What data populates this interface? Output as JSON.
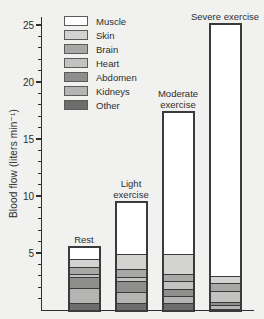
{
  "chart_data": {
    "type": "bar",
    "stacked": true,
    "ylabel": "Blood flow (liters min⁻¹)",
    "categories": [
      {
        "label": "Rest",
        "lines": [
          "Rest"
        ]
      },
      {
        "label": "Light exercise",
        "lines": [
          "Light",
          "exercise"
        ]
      },
      {
        "label": "Moderate exercise",
        "lines": [
          "Moderate",
          "exercise"
        ]
      },
      {
        "label": "Severe exercise",
        "lines": [
          "Severe exercise"
        ]
      }
    ],
    "series": [
      {
        "name": "Muscle",
        "color": "#ffffff",
        "values": [
          1.0,
          4.4,
          12.4,
          22.0
        ]
      },
      {
        "name": "Skin",
        "color": "#d3d3d1",
        "values": [
          0.65,
          1.35,
          1.7,
          0.6
        ]
      },
      {
        "name": "Brain",
        "color": "#a8a8a6",
        "values": [
          0.65,
          0.75,
          0.7,
          0.75
        ]
      },
      {
        "name": "Heart",
        "color": "#c2c2c0",
        "values": [
          0.25,
          0.35,
          0.65,
          0.95
        ]
      },
      {
        "name": "Abdomen",
        "color": "#8e8e8c",
        "values": [
          0.95,
          0.95,
          0.65,
          0.3
        ]
      },
      {
        "name": "Kidneys",
        "color": "#b4b4b2",
        "values": [
          1.35,
          0.9,
          0.6,
          0.3
        ]
      },
      {
        "name": "Other",
        "color": "#6d6d6b",
        "values": [
          0.6,
          0.65,
          0.6,
          0.1
        ]
      }
    ],
    "totals": [
      5.45,
      9.35,
      17.3,
      25.0
    ],
    "ylim": [
      0,
      26
    ],
    "yticks": [
      5,
      10,
      15,
      20,
      25
    ],
    "minor_tick_step": 1,
    "grid": false,
    "legend_position": "upper-left",
    "colors": {
      "background": "#f1f1ef",
      "axis": "#2e2e2e",
      "bar_border": "#3b3b3b",
      "text": "#2e2e2e"
    }
  }
}
